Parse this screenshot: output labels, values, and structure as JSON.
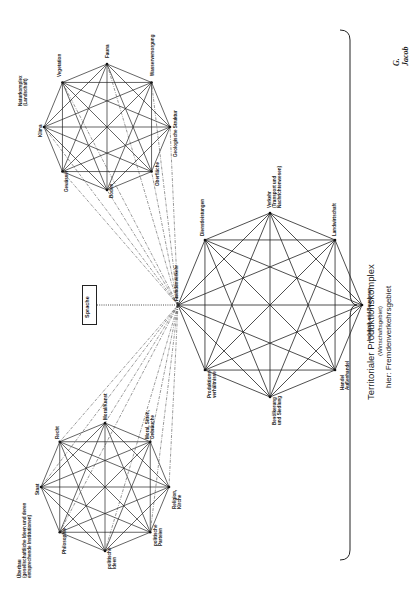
{
  "diagram": {
    "title": "Territorialer Produktionskomplex",
    "subtitle": "(Wirtschaftsgebiet)",
    "caption": "hier: Fremdenverkehrsgebiet",
    "signature": "G. Jacob",
    "center_box": "Sprache",
    "hub_label": "Fremdenverkehr",
    "colors": {
      "line": "#222222",
      "background": "#ffffff"
    },
    "naturkomplex": {
      "title": "Naturkomplex\n(Landschaft)",
      "nodes": [
        "Fauna",
        "Wasserversorgung",
        "Geologische Struktur",
        "Oberfläche",
        "Boden",
        "Gewässer",
        "Klima",
        "Vegetation"
      ]
    },
    "ueberbau": {
      "title": "Überbau\n(gesellschaftliche Ideen und deren\nentsprechende Institutionen)",
      "nodes": [
        "Moral/Kunst",
        "Moral, Sitten,\nGebräuche",
        "Religion,\nKirche",
        "politische\nParteien",
        "politische\nIdeen",
        "Philosophie",
        "Staat",
        "Recht"
      ]
    },
    "produktion": {
      "nodes": [
        "Verkehr\n(Transport und\nNachrichtenwesen)",
        "Landwirtschaft",
        "Industrie und Bauwesen",
        "Handel\nAußenhandel",
        "Bevölkerung\nund Siedlung",
        "Produktions-\nverhältnisse",
        "Fremdenverkehr",
        "Dienstleistungen"
      ]
    }
  }
}
